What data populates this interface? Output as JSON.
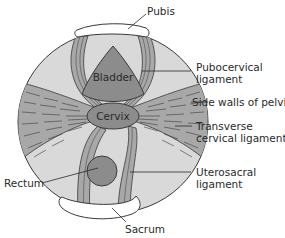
{
  "diagram": {
    "type": "anatomical-cross-section",
    "colors": {
      "background": "#ffffff",
      "pelvis_fill": "#d9d9d9",
      "ligament_fill": "#a8a8a8",
      "organ_fill": "#8c8c8c",
      "outline": "#3a3a3a",
      "bone_fill": "#ffffff"
    },
    "organs": {
      "bladder": "Bladder",
      "cervix": "Cervix"
    },
    "labels": {
      "pubis": "Pubis",
      "pubocervical_1": "Pubocervical",
      "pubocervical_2": "ligament",
      "side_walls": "Side walls of pelvis",
      "transverse_1": "Transverse",
      "transverse_2": "cervical ligament",
      "rectum": "Rectum",
      "uterosacral_1": "Uterosacral",
      "uterosacral_2": "ligament",
      "sacrum": "Sacrum"
    }
  }
}
